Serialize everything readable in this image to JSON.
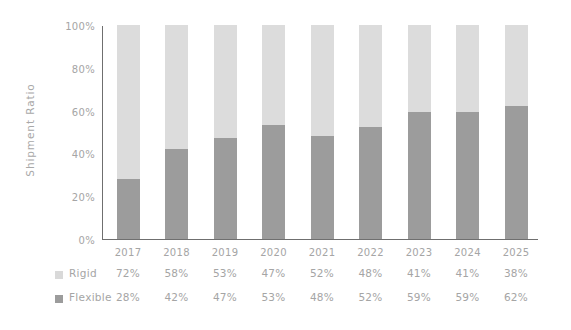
{
  "chart_data": {
    "type": "bar",
    "subtype": "stacked-percentage-column",
    "title": "",
    "xlabel": "",
    "ylabel": "Shipment Ratio",
    "categories": [
      "2017",
      "2018",
      "2019",
      "2020",
      "2021",
      "2022",
      "2023",
      "2024",
      "2025"
    ],
    "series": [
      {
        "name": "Rigid",
        "values": [
          72,
          58,
          53,
          47,
          52,
          48,
          41,
          41,
          38
        ],
        "labels": [
          "72%",
          "58%",
          "53%",
          "47%",
          "52%",
          "48%",
          "41%",
          "41%",
          "38%"
        ],
        "color": "#dcdcdc"
      },
      {
        "name": "Flexible",
        "values": [
          28,
          42,
          47,
          53,
          48,
          52,
          59,
          59,
          62
        ],
        "labels": [
          "28%",
          "42%",
          "47%",
          "53%",
          "48%",
          "52%",
          "59%",
          "59%",
          "62%"
        ],
        "color": "#9c9c9c"
      }
    ],
    "ylim": [
      0,
      100
    ],
    "y_ticks": [
      0,
      20,
      40,
      60,
      80,
      100
    ],
    "y_tick_labels": [
      "0%",
      "20%",
      "40%",
      "60%",
      "80%",
      "100%"
    ],
    "grid": false,
    "legend_position": "bottom-left",
    "stack_order_bottom_to_top": [
      "Flexible",
      "Rigid"
    ]
  },
  "axis": {
    "y_title": "Shipment Ratio"
  },
  "legend": {
    "rigid_label": "Rigid",
    "flexible_label": "Flexible"
  },
  "colors": {
    "rigid": "#dcdcdc",
    "flexible": "#9c9c9c",
    "axis_line": "#6f6f6f",
    "text": "#a5a5a5",
    "background": "#ffffff"
  }
}
